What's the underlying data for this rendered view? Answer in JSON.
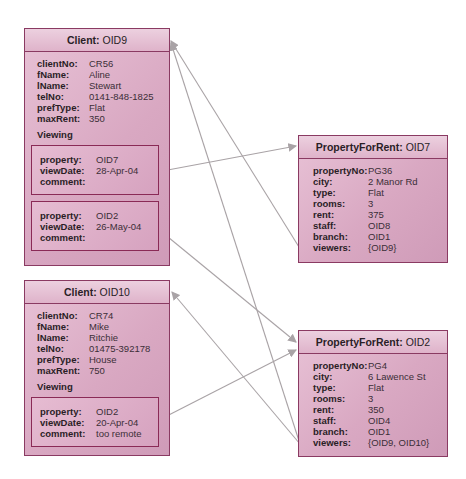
{
  "colors": {
    "box_border": "#8a3a62",
    "box_fill": "#d9a8c2",
    "connector": "#a9a3a6"
  },
  "clients": [
    {
      "class_label": "Client:",
      "oid": "OID9",
      "attributes": [
        {
          "key": "clientNo:",
          "value": "CR56"
        },
        {
          "key": "fName:",
          "value": "Aline"
        },
        {
          "key": "lName:",
          "value": "Stewart"
        },
        {
          "key": "telNo:",
          "value": "0141-848-1825"
        },
        {
          "key": "prefType:",
          "value": "Flat"
        },
        {
          "key": "maxRent:",
          "value": "350"
        }
      ],
      "viewing_label": "Viewing",
      "viewings": [
        {
          "property_key": "property:",
          "property": "OID7",
          "date_key": "viewDate:",
          "viewDate": "28-Apr-04",
          "comment_key": "comment:",
          "comment": ""
        },
        {
          "property_key": "property:",
          "property": "OID2",
          "date_key": "viewDate:",
          "viewDate": "26-May-04",
          "comment_key": "comment:",
          "comment": ""
        }
      ]
    },
    {
      "class_label": "Client:",
      "oid": "OID10",
      "attributes": [
        {
          "key": "clientNo:",
          "value": "CR74"
        },
        {
          "key": "fName:",
          "value": "Mike"
        },
        {
          "key": "lName:",
          "value": "Ritchie"
        },
        {
          "key": "telNo:",
          "value": "01475-392178"
        },
        {
          "key": "prefType:",
          "value": "House"
        },
        {
          "key": "maxRent:",
          "value": "750"
        }
      ],
      "viewing_label": "Viewing",
      "viewings": [
        {
          "property_key": "property:",
          "property": "OID2",
          "date_key": "viewDate:",
          "viewDate": "20-Apr-04",
          "comment_key": "comment:",
          "comment": "too remote"
        }
      ]
    }
  ],
  "properties": [
    {
      "class_label": "PropertyForRent:",
      "oid": "OID7",
      "attributes": [
        {
          "key": "propertyNo:",
          "value": "PG36"
        },
        {
          "key": "city:",
          "value": "2 Manor Rd"
        },
        {
          "key": "type:",
          "value": "Flat"
        },
        {
          "key": "rooms:",
          "value": "3"
        },
        {
          "key": "rent:",
          "value": "375"
        },
        {
          "key": "staff:",
          "value": "OID8"
        },
        {
          "key": "branch:",
          "value": "OID1"
        },
        {
          "key": "viewers:",
          "value": "{OID9}"
        }
      ]
    },
    {
      "class_label": "PropertyForRent:",
      "oid": "OID2",
      "attributes": [
        {
          "key": "propertyNo:",
          "value": "PG4"
        },
        {
          "key": "city:",
          "value": "6 Lawence St"
        },
        {
          "key": "type:",
          "value": "Flat"
        },
        {
          "key": "rooms:",
          "value": "3"
        },
        {
          "key": "rent:",
          "value": "350"
        },
        {
          "key": "staff:",
          "value": "OID4"
        },
        {
          "key": "branch:",
          "value": "OID1"
        },
        {
          "key": "viewers:",
          "value": "{OID9, OID10}"
        }
      ]
    }
  ]
}
